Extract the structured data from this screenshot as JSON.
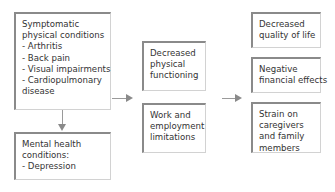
{
  "diagram": {
    "left_column": {
      "physical": {
        "title_lines": [
          "Symptomatic",
          "physical conditions"
        ],
        "items": [
          "- Arthritis",
          "- Back pain",
          "- Visual impairments",
          "- Cardiopulmonary",
          "disease"
        ]
      },
      "mental": {
        "title_lines": [
          "Mental health",
          "conditions:"
        ],
        "items": [
          "- Depression"
        ]
      }
    },
    "middle_column": [
      {
        "lines": [
          "Decreased",
          "physical",
          "functioning"
        ]
      },
      {
        "lines": [
          "Work and",
          "employment",
          "limitations"
        ]
      }
    ],
    "right_column": [
      {
        "lines": [
          "Decreased",
          "quality of life"
        ]
      },
      {
        "lines": [
          "Negative",
          "financial effects"
        ]
      },
      {
        "lines": [
          "Strain on",
          "caregivers",
          "and family",
          "members"
        ]
      }
    ],
    "colors": {
      "border": "#8a8a8a",
      "arrow": "#8a8a8a",
      "text": "#333333"
    }
  }
}
